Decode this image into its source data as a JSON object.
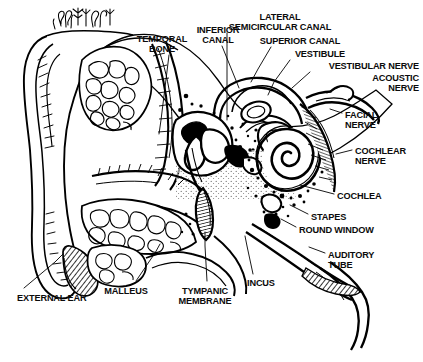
{
  "figure": {
    "palette": {
      "ink": "#000000",
      "paper": "#ffffff",
      "label": "#0b0b0b"
    },
    "caption": ""
  },
  "labels": [
    {
      "id": "temporal-bone",
      "text": "TEMPORAL\nBONE",
      "x": 162,
      "y": 34,
      "align": "ctr"
    },
    {
      "id": "inferior-canal",
      "text": "INFERIOR\nCANAL",
      "x": 218,
      "y": 25,
      "align": "ctr"
    },
    {
      "id": "lateral-semicircular-canal",
      "text": "LATERAL\nSEMICIRCULAR CANAL",
      "x": 280,
      "y": 12,
      "align": "ctr"
    },
    {
      "id": "superior-canal",
      "text": "SUPERIOR CANAL",
      "x": 300,
      "y": 36,
      "align": "ctr"
    },
    {
      "id": "vestibule",
      "text": "VESTIBULE",
      "x": 320,
      "y": 49,
      "align": "ctr"
    },
    {
      "id": "vestibular-nerve",
      "text": "VESTIBULAR NERVE",
      "x": 419,
      "y": 61,
      "align": "rgt"
    },
    {
      "id": "acoustic-nerve",
      "text": "ACOUSTIC\nNERVE",
      "x": 419,
      "y": 73,
      "align": "rgt"
    },
    {
      "id": "facial-nerve",
      "text": "FACIAL\nNERVE",
      "x": 345,
      "y": 110,
      "align": "lft"
    },
    {
      "id": "cochlear-nerve",
      "text": "COCHLEAR\nNERVE",
      "x": 355,
      "y": 146,
      "align": "lft"
    },
    {
      "id": "cochlea",
      "text": "COCHLEA",
      "x": 337,
      "y": 191,
      "align": "lft"
    },
    {
      "id": "stapes",
      "text": "STAPES",
      "x": 311,
      "y": 212,
      "align": "lft"
    },
    {
      "id": "round-window",
      "text": "ROUND WINDOW",
      "x": 299,
      "y": 225,
      "align": "lft"
    },
    {
      "id": "auditory-tube",
      "text": "AUDITORY\nTUBE",
      "x": 328,
      "y": 250,
      "align": "lft"
    },
    {
      "id": "incus",
      "text": "INCUS",
      "x": 247,
      "y": 278,
      "align": "lft"
    },
    {
      "id": "tympanic-membrane",
      "text": "TYMPANIC\nMEMBRANE",
      "x": 205,
      "y": 286,
      "align": "ctr"
    },
    {
      "id": "malleus",
      "text": "MALLEUS",
      "x": 126,
      "y": 286,
      "align": "ctr"
    },
    {
      "id": "external-ear",
      "text": "EXTERNAL EAR",
      "x": 17,
      "y": 293,
      "align": "lft"
    }
  ],
  "leaders": [
    {
      "id": "leader-temporal-bone",
      "points": "169,55 161,120 159,134"
    },
    {
      "id": "leader-inferior-canal",
      "points": "222,46 235,78 239,88"
    },
    {
      "id": "leader-lateral-semicircular-canal",
      "points": "227,33 227,120"
    },
    {
      "id": "leader-superior-canal",
      "points": "271,47 258,69 251,82"
    },
    {
      "id": "leader-vestibule",
      "points": "290,60 274,82 268,95"
    },
    {
      "id": "leader-vestibular-nerve",
      "points": "310,72 292,88"
    },
    {
      "id": "leader-acoustic-nerve",
      "points": "341,86 327,93"
    },
    {
      "id": "leader-facial-nerve",
      "points": "342,113 330,109"
    },
    {
      "id": "leader-cochlear-nerve",
      "points": "352,150 336,154"
    },
    {
      "id": "leader-cochlea",
      "points": "334,194 300,185"
    },
    {
      "id": "leader-stapes",
      "points": "308,214 290,205"
    },
    {
      "id": "leader-round-window",
      "points": "296,227 281,219"
    },
    {
      "id": "leader-auditory-tube",
      "points": "325,253 309,247"
    },
    {
      "id": "leader-incus",
      "points": "253,274 247,246 245,236"
    },
    {
      "id": "leader-tympanic-membrane",
      "points": "207,281 205,246 205,232"
    },
    {
      "id": "leader-malleus",
      "points": "136,281 155,253 160,244"
    },
    {
      "id": "leader-external-ear",
      "points": "24,288 55,262 63,254"
    }
  ],
  "structures": {
    "pinna": "outer ear auricle, left margin",
    "ear_canal": "external auditory meatus",
    "mastoid": "mastoid air cells stipple",
    "cochlea_turns": 3.25,
    "bone_stipple": true
  }
}
